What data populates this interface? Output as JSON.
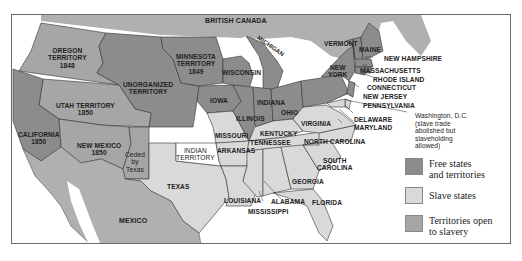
{
  "map": {
    "colors": {
      "free": "#8c8c8c",
      "slave": "#d9d9d9",
      "territory_open": "#a6a6a6",
      "foreign": "#b0b0b0",
      "water": "#ffffff",
      "neutral_white": "#ffffff",
      "border": "#333333"
    },
    "regions": {
      "british_canada": "BRITISH CANADA",
      "oregon": [
        "OREGON",
        "TERRITORY",
        "1848"
      ],
      "minnesota": [
        "MINNESOTA",
        "TERRITORY",
        "1849"
      ],
      "unorganized": [
        "UNORGANIZED",
        "TERRITORY"
      ],
      "utah": [
        "UTAH TERRITORY",
        "1850"
      ],
      "california": [
        "CALIFORNIA",
        "1850"
      ],
      "new_mexico": [
        "NEW MEXICO",
        "1850"
      ],
      "ceded": [
        "Ceded",
        "by",
        "Texas"
      ],
      "wisconsin": "WISCONSIN",
      "michigan": "MICHIGAN",
      "iowa": "IOWA",
      "illinois": "ILLINOIS",
      "indiana": "INDIANA",
      "ohio": "OHIO",
      "missouri": "MISSOURI",
      "kentucky": "KENTUCKY",
      "virginia": "VIRGINIA",
      "indian_territory": [
        "INDIAN",
        "TERRITORY"
      ],
      "arkansas": "ARKANSAS",
      "tennessee": "TENNESSEE",
      "north_carolina": "NORTH CAROLINA",
      "south_carolina": [
        "SOUTH",
        "CAROLINA"
      ],
      "georgia": "GEORGIA",
      "alabama": "ALABAMA",
      "mississippi": "MISSISSIPPI",
      "louisiana": "LOUISIANA",
      "florida": "FLORIDA",
      "texas": "TEXAS",
      "mexico": "MEXICO",
      "vermont": "VERMONT",
      "maine": "MAINE",
      "new_york": [
        "NEW",
        "YORK"
      ],
      "new_hampshire": "NEW HAMPSHIRE",
      "massachusetts": "MASSACHUSETTS",
      "rhode_island": "RHODE ISLAND",
      "connecticut": "CONNECTICUT",
      "new_jersey": "NEW JERSEY",
      "pennsylvania": "PENNSYLVANIA",
      "delaware": "DELAWARE",
      "maryland": "MARYLAND"
    },
    "annotation_dc": [
      "Washington, D.C.",
      "(slave trade",
      "abolished but",
      "slaveholding",
      "allowed)"
    ]
  },
  "legend": {
    "items": [
      {
        "label_lines": [
          "Free states",
          "and territories"
        ],
        "swatch_color": "#8c8c8c"
      },
      {
        "label_lines": [
          "Slave states"
        ],
        "swatch_color": "#d9d9d9"
      },
      {
        "label_lines": [
          "Territories open",
          "to slavery"
        ],
        "swatch_color": "#a6a6a6"
      }
    ]
  }
}
